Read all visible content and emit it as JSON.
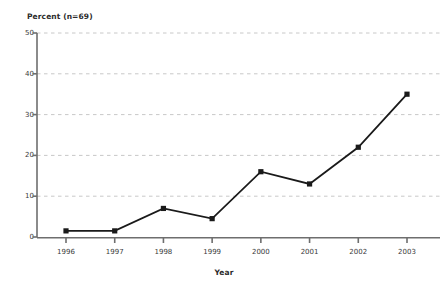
{
  "chart_data": {
    "type": "line",
    "title": "",
    "ylabel": "Percent (n=69)",
    "xlabel": "Year",
    "categories": [
      "1996",
      "1997",
      "1998",
      "1999",
      "2000",
      "2001",
      "2002",
      "2003"
    ],
    "values": [
      1.5,
      1.5,
      7,
      4.5,
      16,
      13,
      22,
      35
    ],
    "ylim": [
      0,
      50
    ],
    "yticks": [
      "0",
      "10",
      "20",
      "30",
      "40",
      "50"
    ],
    "ytick_values": [
      0,
      10,
      20,
      30,
      40,
      50
    ],
    "grid": "horizontal-dashed",
    "legend": "none",
    "series": [
      {
        "name": "Percent",
        "values": [
          1.5,
          1.5,
          7,
          4.5,
          16,
          13,
          22,
          35
        ]
      }
    ],
    "marker": "square",
    "colors": {
      "line": "#1a1a1a",
      "marker": "#1a1a1a",
      "grid": "#c8c8c8",
      "axis": "#6e6e6e",
      "text": "#2b2b2b",
      "background": "#ffffff"
    }
  }
}
